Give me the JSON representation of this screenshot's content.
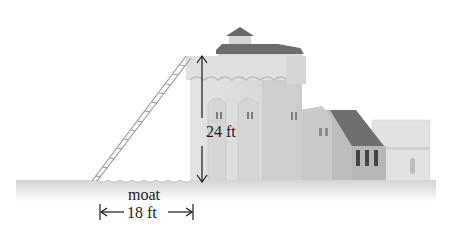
{
  "diagram": {
    "labels": {
      "height": "24 ft",
      "moat": "moat",
      "distance": "18 ft"
    },
    "measurements": {
      "wall_height_ft": 24,
      "moat_width_ft": 18
    },
    "colors": {
      "background": "#ffffff",
      "ground": "#d9d9d9",
      "wall_light": "#dedede",
      "wall_mid": "#cfcfcf",
      "roof_dark": "#6e6e6e",
      "arrow": "#1a1a1a"
    }
  }
}
